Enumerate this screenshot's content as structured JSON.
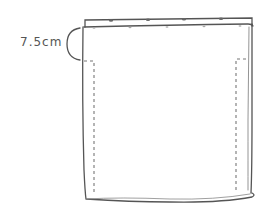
{
  "diagram": {
    "measurement_label": "7.5cm",
    "colors": {
      "line": "#555555",
      "stitch": "#777777",
      "background": "#ffffff"
    },
    "elements": [
      {
        "type": "folded-hem",
        "description": "top folded strip with pin marks"
      },
      {
        "type": "panel",
        "description": "main rectangular fabric piece"
      },
      {
        "type": "stitch-line",
        "side": "left",
        "style": "dashed"
      },
      {
        "type": "stitch-line",
        "side": "right",
        "style": "dashed"
      },
      {
        "type": "measurement-brace",
        "label": "7.5cm"
      }
    ]
  }
}
